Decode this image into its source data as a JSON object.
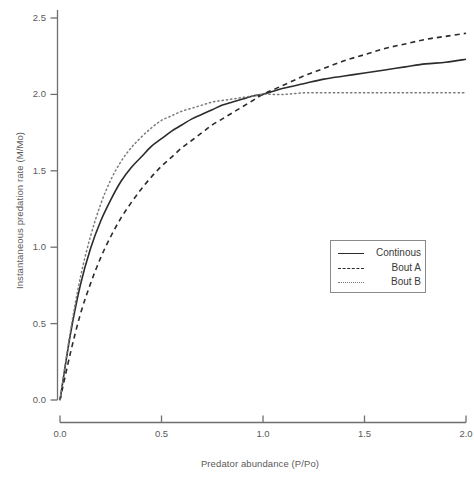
{
  "chart_data": {
    "type": "line",
    "title": "",
    "xlabel": "Predator abundance (P/Po)",
    "ylabel": "Instantaneous predation rate (M/Mo)",
    "xlim": [
      0.0,
      2.0
    ],
    "ylim": [
      0.0,
      2.5
    ],
    "xticks": [
      "0.0",
      "0.5",
      "1.0",
      "1.5",
      "2.0"
    ],
    "yticks": [
      "0.0",
      "0.5",
      "1.0",
      "1.5",
      "2.0",
      "2.5"
    ],
    "xtick_values": [
      0.0,
      0.5,
      1.0,
      1.5,
      2.0
    ],
    "ytick_values": [
      0.0,
      0.5,
      1.0,
      1.5,
      2.0,
      2.5
    ],
    "grid": false,
    "legend_position": "center-right",
    "x": [
      0.0,
      0.05,
      0.1,
      0.15,
      0.2,
      0.25,
      0.3,
      0.35,
      0.4,
      0.45,
      0.5,
      0.55,
      0.6,
      0.65,
      0.7,
      0.75,
      0.8,
      0.85,
      0.9,
      0.95,
      1.0,
      1.1,
      1.2,
      1.3,
      1.4,
      1.5,
      1.6,
      1.7,
      1.8,
      1.9,
      2.0
    ],
    "series": [
      {
        "name": "Continous",
        "style": "solid",
        "color": "#2b2b2b",
        "values": [
          0.0,
          0.42,
          0.75,
          0.99,
          1.17,
          1.31,
          1.43,
          1.52,
          1.59,
          1.66,
          1.71,
          1.76,
          1.8,
          1.84,
          1.87,
          1.9,
          1.93,
          1.95,
          1.97,
          1.99,
          2.0,
          2.04,
          2.07,
          2.1,
          2.12,
          2.14,
          2.16,
          2.18,
          2.2,
          2.21,
          2.23
        ]
      },
      {
        "name": "Bout A",
        "style": "dashed",
        "color": "#2b2b2b",
        "values": [
          0.0,
          0.3,
          0.56,
          0.76,
          0.93,
          1.07,
          1.19,
          1.29,
          1.38,
          1.46,
          1.53,
          1.59,
          1.65,
          1.7,
          1.75,
          1.8,
          1.84,
          1.88,
          1.92,
          1.96,
          2.0,
          2.06,
          2.12,
          2.17,
          2.22,
          2.26,
          2.3,
          2.33,
          2.36,
          2.38,
          2.4
        ]
      },
      {
        "name": "Bout B",
        "style": "dotted",
        "color": "#7a7a7a",
        "values": [
          0.0,
          0.44,
          0.8,
          1.07,
          1.28,
          1.44,
          1.56,
          1.65,
          1.72,
          1.78,
          1.83,
          1.86,
          1.89,
          1.91,
          1.93,
          1.95,
          1.96,
          1.97,
          1.98,
          1.99,
          2.0,
          2.0,
          2.01,
          2.01,
          2.01,
          2.01,
          2.01,
          2.01,
          2.01,
          2.01,
          2.01
        ]
      }
    ]
  },
  "legend": {
    "items": [
      {
        "label": "Continous"
      },
      {
        "label": "Bout A"
      },
      {
        "label": "Bout B"
      }
    ]
  },
  "axes": {
    "x_label": "Predator abundance (P/Po)",
    "y_label": "Instantaneous predation rate (M/Mo)"
  }
}
